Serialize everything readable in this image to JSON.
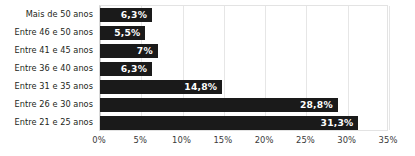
{
  "chart_data": {
    "type": "bar",
    "orientation": "horizontal",
    "title": "",
    "subtitle": "",
    "xlabel": "",
    "ylabel": "",
    "xlim": [
      0,
      35
    ],
    "xtick_step": 5,
    "grid": true,
    "legend": false,
    "bar_color": "#1a1a1a",
    "label_color": "#ffffff",
    "categories": [
      "Mais de 50 anos",
      "Entre 46 e 50 anos",
      "Entre 41 e 45 anos",
      "Entre 36 e 40 anos",
      "Entre 31 e 35 anos",
      "Entre 26 e 30 anos",
      "Entre 21 e 25 anos"
    ],
    "values": [
      6.3,
      5.5,
      7.0,
      6.3,
      14.8,
      28.8,
      31.3
    ],
    "value_labels": [
      "6,3%",
      "5,5%",
      "7%",
      "6,3%",
      "14,8%",
      "28,8%",
      "31,3%"
    ],
    "xtick_values": [
      0,
      5,
      10,
      15,
      20,
      25,
      30,
      35
    ],
    "xtick_labels": [
      "0%",
      "5%",
      "10%",
      "15%",
      "20%",
      "25%",
      "30%",
      "35%"
    ]
  }
}
